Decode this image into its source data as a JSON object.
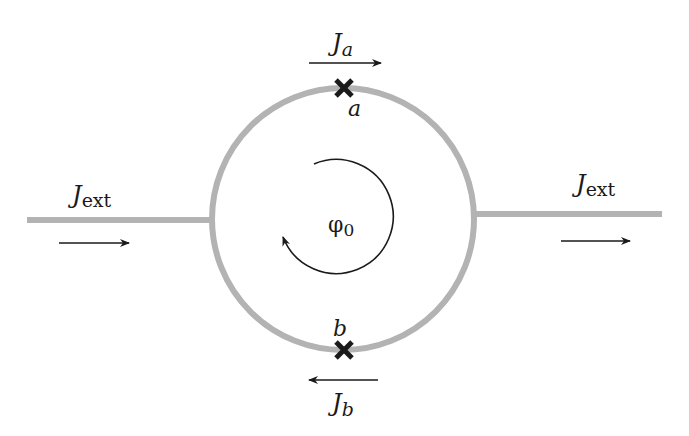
{
  "diagram": {
    "type": "SQUID loop with two Josephson junctions",
    "colors": {
      "wire": "#b3b3b3",
      "ink": "#1a1a1a",
      "background": "#ffffff"
    },
    "current_left": {
      "symbol": "J",
      "subscript": "ext",
      "direction": "right"
    },
    "current_right": {
      "symbol": "J",
      "subscript": "ext",
      "direction": "right"
    },
    "current_top": {
      "symbol": "J",
      "subscript": "a",
      "direction": "right"
    },
    "current_bottom": {
      "symbol": "J",
      "subscript": "b",
      "direction": "left"
    },
    "junction_top": {
      "label": "a",
      "marker": "cross"
    },
    "junction_bottom": {
      "label": "b",
      "marker": "cross"
    },
    "flux": {
      "symbol": "φ",
      "subscript": "0",
      "circulation": "clockwise"
    }
  }
}
